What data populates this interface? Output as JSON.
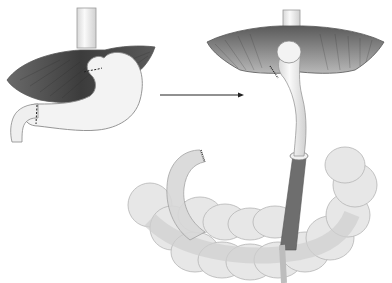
{
  "figure": {
    "type": "surgical-illustration",
    "panels": [
      {
        "id": "before",
        "label": "",
        "content": "stomach with omentum, dashed resection lines at cardia and pylorus"
      },
      {
        "id": "after",
        "label": "",
        "content": "gastric tube pulled up, retrocolic route through transverse colon with stapled duodenal stump"
      }
    ],
    "arrow": {
      "direction": "right"
    },
    "colors": {
      "background": "#ffffff",
      "organ_fill": "#f1f1f1",
      "organ_stroke": "#8a8a8a",
      "omentum_dark": "#4a4a4a",
      "omentum_mid": "#8c8c8c",
      "colon_fill": "#e6e6e6",
      "tunnel_dark": "#6e6e6e"
    }
  }
}
